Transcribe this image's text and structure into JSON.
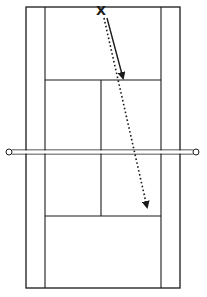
{
  "diagram": {
    "type": "tennis-court-top-view",
    "colors": {
      "background": "#ffffff",
      "lines": "#1a1a1a",
      "net_posts": "#ffffff"
    },
    "court": {
      "doubles_outer": {
        "x1": 26,
        "y1": 7,
        "x2": 180,
        "y2": 288
      },
      "singles_left_x": 45,
      "singles_right_x": 161,
      "service_line_top_y": 80,
      "service_line_bottom_y": 216,
      "center_service_x": 101
    },
    "net": {
      "y": 152,
      "x1": 10,
      "x2": 195,
      "post_radius": 3
    },
    "player": {
      "label": "X",
      "x": 101,
      "y": 12
    },
    "shots": [
      {
        "name": "serve-path-solid",
        "style": "solid",
        "from": [
          107,
          18
        ],
        "to": [
          124,
          80
        ]
      },
      {
        "name": "shot-path-dotted",
        "style": "dotted",
        "from": [
          104,
          18
        ],
        "to": [
          148,
          210
        ]
      }
    ]
  }
}
